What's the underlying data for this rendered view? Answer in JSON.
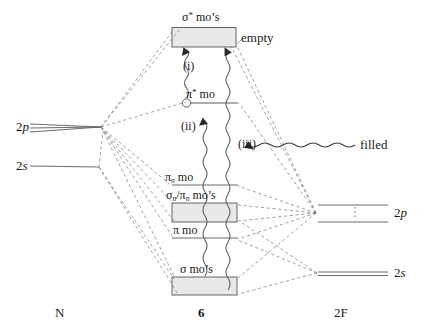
{
  "diagram": {
    "title_hidden": "Molecular orbital correlation diagram",
    "fragment_labels": {
      "left": "N",
      "center": "6",
      "right": "2F"
    },
    "left_levels": [
      {
        "name": "2p",
        "label_main": "2",
        "label_italic": "p",
        "type": "triple-line"
      },
      {
        "name": "2s",
        "label_main": "2",
        "label_italic": "s",
        "type": "single-line"
      }
    ],
    "right_levels": [
      {
        "name": "2p",
        "label_main": "2",
        "label_italic": "p",
        "type": "double-line-dotted"
      },
      {
        "name": "2s",
        "label_main": "2",
        "label_italic": "s",
        "type": "double-line"
      }
    ],
    "center_levels": [
      {
        "name": "sigma-star-mos",
        "label": "σ* mo's",
        "shape": "box",
        "filled": false
      },
      {
        "name": "pi-star-mo",
        "label": "π* mo",
        "shape": "line",
        "marker": "circle"
      },
      {
        "name": "pi-n-mo",
        "label": "πn mo",
        "shape": "line"
      },
      {
        "name": "sigma-n-pi-n-mos",
        "label": "σn/πn mo's",
        "shape": "box"
      },
      {
        "name": "pi-mo",
        "label": "π mo",
        "shape": "line"
      },
      {
        "name": "sigma-mos",
        "label": "σ mo's",
        "shape": "box"
      }
    ],
    "annotations": {
      "empty": "empty",
      "filled": "filled",
      "transition_i": "(i)",
      "transition_ii": "(ii)",
      "transition_iii": "(iii)"
    },
    "colors": {
      "stroke": "#4a4a4a",
      "box_fill": "#e8e8e8",
      "text": "#1a1a1a"
    }
  }
}
